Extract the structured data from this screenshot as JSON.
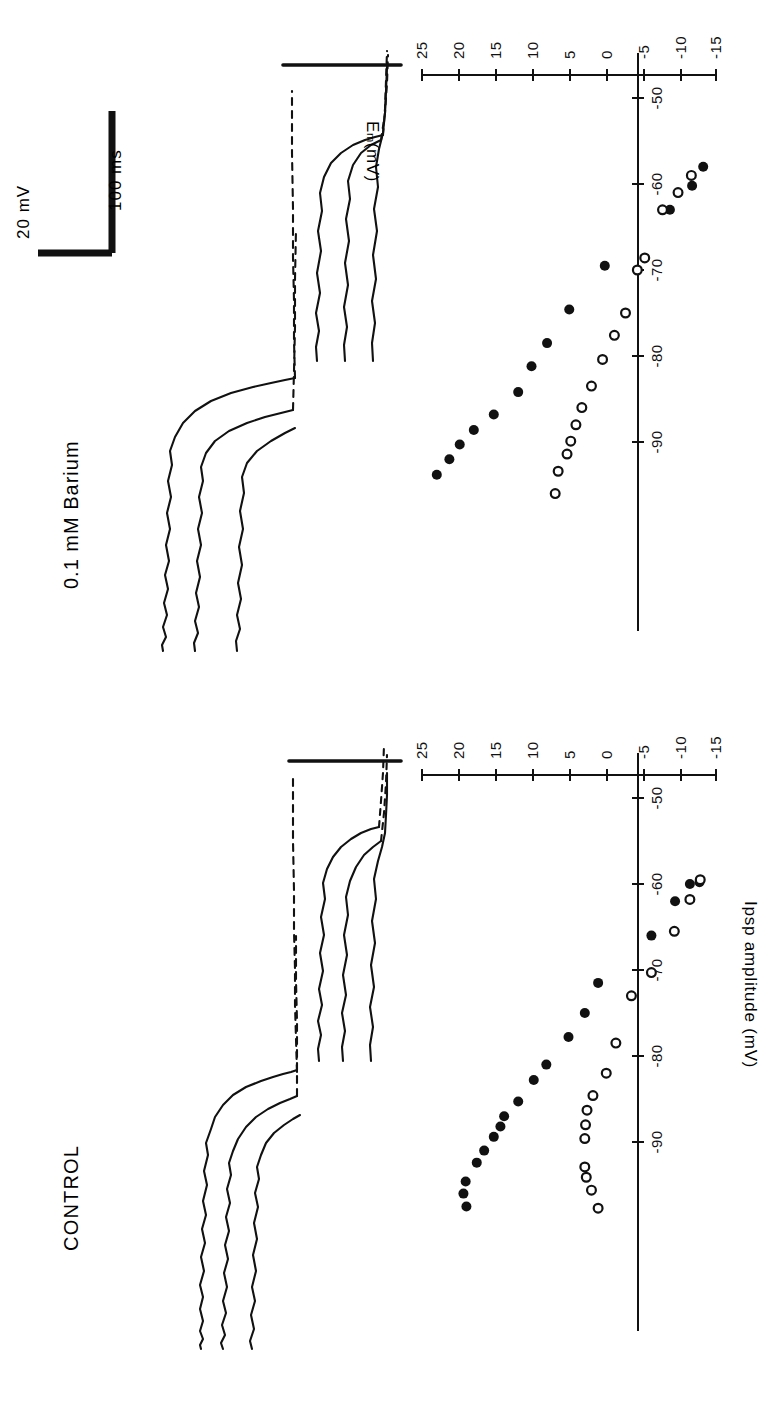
{
  "figure": {
    "orientation": "rotated-90-ccw",
    "ink_color": "#111111",
    "background": "#ffffff"
  },
  "panels": [
    {
      "id": "control",
      "title": "CONTROL",
      "scalebar": {
        "voltage": "",
        "time": ""
      }
    },
    {
      "id": "barium",
      "title": "0.1 mM  Barium",
      "scalebar": {
        "voltage": "20 mV",
        "time": "100 ms"
      }
    }
  ],
  "axes": {
    "y_label": "Ipsp amplitude (mV)",
    "x_label_main": "E",
    "x_label_sub": "m",
    "x_label_unit": "(mV)",
    "y_ticks": [
      "25",
      "20",
      "15",
      "10",
      "5",
      "0",
      "-5",
      "-10",
      "-15"
    ],
    "y_tick_values": [
      25,
      20,
      15,
      10,
      5,
      0,
      -5,
      -10,
      -15
    ],
    "x_ticks": [
      "-50",
      "-60",
      "-70",
      "-80",
      "-90"
    ],
    "x_tick_values": [
      -50,
      -60,
      -70,
      -80,
      -90
    ],
    "ylim": [
      -15,
      25
    ],
    "xlim": [
      -100,
      -48
    ]
  },
  "chart_data": [
    {
      "type": "scatter",
      "title": "CONTROL",
      "xlabel": "Em (mV)",
      "ylabel": "Ipsp amplitude (mV)",
      "xlim": [
        -100,
        -48
      ],
      "ylim": [
        -15,
        25
      ],
      "grid": false,
      "legend": "none",
      "series": [
        {
          "name": "filled-circles",
          "marker": "filled",
          "points": [
            [
              -97.5,
              19.0
            ],
            [
              -96.0,
              19.4
            ],
            [
              -94.6,
              19.1
            ],
            [
              -92.4,
              17.6
            ],
            [
              -91.0,
              16.6
            ],
            [
              -89.4,
              15.3
            ],
            [
              -88.2,
              14.4
            ],
            [
              -87.0,
              13.9
            ],
            [
              -85.3,
              12.0
            ],
            [
              -82.8,
              9.9
            ],
            [
              -81.0,
              8.2
            ],
            [
              -77.8,
              5.2
            ],
            [
              -75.0,
              3.0
            ],
            [
              -71.5,
              1.2
            ],
            [
              -66.0,
              -6.0
            ],
            [
              -62.0,
              -9.2
            ],
            [
              -60.0,
              -11.2
            ],
            [
              -59.8,
              -12.5
            ]
          ]
        },
        {
          "name": "open-circles",
          "marker": "open",
          "points": [
            [
              -97.7,
              1.2
            ],
            [
              -95.6,
              2.1
            ],
            [
              -94.1,
              2.8
            ],
            [
              -92.9,
              3.0
            ],
            [
              -89.6,
              3.0
            ],
            [
              -88.0,
              2.9
            ],
            [
              -86.3,
              2.7
            ],
            [
              -84.6,
              1.9
            ],
            [
              -82.0,
              0.1
            ],
            [
              -78.5,
              -1.2
            ],
            [
              -73.0,
              -3.3
            ],
            [
              -70.3,
              -6.0
            ],
            [
              -65.5,
              -9.1
            ],
            [
              -61.8,
              -11.2
            ],
            [
              -59.5,
              -12.6
            ]
          ]
        }
      ]
    },
    {
      "type": "scatter",
      "title": "0.1 mM Barium",
      "xlabel": "Em (mV)",
      "ylabel": "Ipsp amplitude (mV)",
      "xlim": [
        -100,
        -48
      ],
      "ylim": [
        -15,
        25
      ],
      "grid": false,
      "legend": "none",
      "series": [
        {
          "name": "filled-circles",
          "marker": "filled",
          "points": [
            [
              -93.8,
              23.0
            ],
            [
              -92.0,
              21.3
            ],
            [
              -90.3,
              19.9
            ],
            [
              -88.6,
              18.0
            ],
            [
              -86.8,
              15.3
            ],
            [
              -84.2,
              12.0
            ],
            [
              -81.2,
              10.2
            ],
            [
              -78.5,
              8.1
            ],
            [
              -74.6,
              5.1
            ],
            [
              -69.5,
              0.3
            ],
            [
              -63.0,
              -8.5
            ],
            [
              -60.2,
              -11.5
            ],
            [
              -58.0,
              -13.0
            ]
          ]
        },
        {
          "name": "open-circles",
          "marker": "open",
          "points": [
            [
              -96.0,
              7.0
            ],
            [
              -93.4,
              6.6
            ],
            [
              -91.4,
              5.4
            ],
            [
              -89.9,
              4.9
            ],
            [
              -88.0,
              4.2
            ],
            [
              -86.0,
              3.4
            ],
            [
              -83.5,
              2.1
            ],
            [
              -80.4,
              0.6
            ],
            [
              -77.6,
              -1.0
            ],
            [
              -75.0,
              -2.5
            ],
            [
              -70.0,
              -4.1
            ],
            [
              -68.6,
              -5.1
            ],
            [
              -63.0,
              -7.5
            ],
            [
              -61.0,
              -9.6
            ],
            [
              -59.0,
              -11.4
            ]
          ]
        }
      ]
    }
  ],
  "traces": {
    "count_per_panel": 3,
    "description_control": "three superimposed intracellular voltage traces (control)",
    "description_barium": "three superimposed intracellular voltage traces (0.1 mM barium)"
  }
}
